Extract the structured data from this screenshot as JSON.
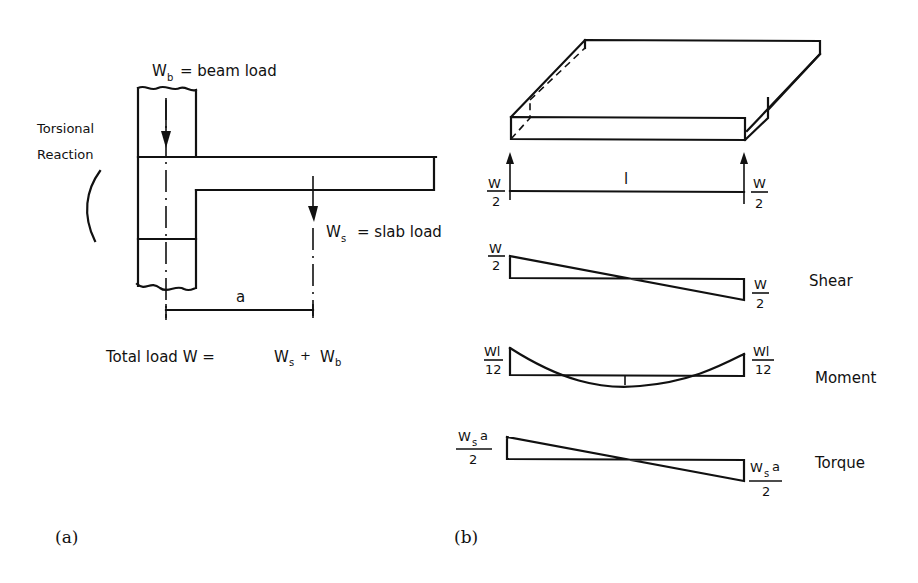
{
  "figure": {
    "panel_a": {
      "caption": "(a)",
      "beam_load_label": {
        "symbol": "W",
        "subscript": "b",
        "text": "= beam  load"
      },
      "slab_load_label": {
        "symbol": "W",
        "subscript": "s",
        "text": "= slab  load"
      },
      "torsional_reaction_label": [
        "Torsional",
        "Reaction"
      ],
      "dimension_label": "a",
      "total_load": {
        "prefix": "Total  load   W =",
        "term1": "W",
        "term1_sub": "s",
        "plus": "+",
        "term2": "W",
        "term2_sub": "b"
      }
    },
    "panel_b": {
      "caption": "(b)",
      "span_label": "l",
      "reactions": {
        "left": {
          "numerator": "W",
          "denominator": "2"
        },
        "right": {
          "numerator": "W",
          "denominator": "2"
        }
      },
      "diagrams": [
        {
          "name": "Shear",
          "left": {
            "numerator": "W",
            "denominator": "2"
          },
          "right": {
            "numerator": "W",
            "denominator": "2"
          }
        },
        {
          "name": "Moment",
          "left": {
            "numerator": "Wl",
            "denominator": "12"
          },
          "right": {
            "numerator": "Wl",
            "denominator": "12"
          }
        },
        {
          "name": "Torque",
          "left": {
            "numerator": "W",
            "numerator_sub": "s",
            "numerator_tail": "a",
            "denominator": "2"
          },
          "right": {
            "numerator": "W",
            "numerator_sub": "s",
            "numerator_tail": "a",
            "denominator": "2"
          }
        }
      ]
    }
  }
}
